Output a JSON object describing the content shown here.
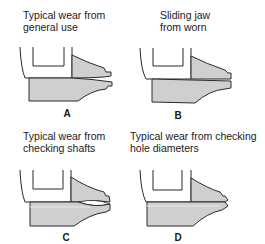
{
  "figure": {
    "panels": [
      {
        "id": "A",
        "letter": "A",
        "caption": "Typical wear from\ngeneral use"
      },
      {
        "id": "B",
        "letter": "B",
        "caption": "Sliding jaw\nfrom worn"
      },
      {
        "id": "C",
        "letter": "C",
        "caption": "Typical wear from\nchecking shafts"
      },
      {
        "id": "D",
        "letter": "D",
        "caption": "Typical wear from checking\nhole diameters"
      }
    ],
    "colors": {
      "jaw_fill": "#cfcfcf",
      "outline": "#2a2a2a",
      "background": "#ffffff"
    }
  }
}
